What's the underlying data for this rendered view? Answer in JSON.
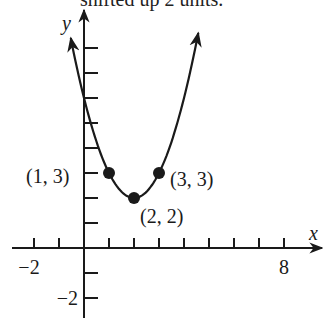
{
  "clipped_caption": "shifted up 2 units.",
  "chart_data": {
    "type": "line",
    "title": "",
    "function": "y = (x - 2)^2 + 2",
    "xlabel": "x",
    "ylabel": "y",
    "x_tick_labels": [
      {
        "value": -2,
        "label": "−2"
      },
      {
        "value": 8,
        "label": "8"
      }
    ],
    "y_tick_labels": [
      {
        "value": -2,
        "label": "−2"
      }
    ],
    "x_ticks": [
      -2,
      -1,
      1,
      2,
      3,
      4,
      5,
      6,
      7,
      8
    ],
    "y_ticks": [
      -2,
      -1,
      1,
      2,
      3,
      4,
      5,
      6,
      7,
      8
    ],
    "xlim": [
      -2.9,
      9.5
    ],
    "ylim": [
      -2.8,
      9.5
    ],
    "grid": false,
    "curve_x_range": [
      -0.53,
      4.57
    ],
    "points": [
      {
        "x": 1,
        "y": 3,
        "label": "(1, 3)"
      },
      {
        "x": 2,
        "y": 2,
        "label": "(2, 2)"
      },
      {
        "x": 3,
        "y": 3,
        "label": "(3, 3)"
      }
    ]
  },
  "layout": {
    "origin_px": [
      84,
      248
    ],
    "unit_px": 25,
    "stroke_color": "#1a1a1a"
  }
}
